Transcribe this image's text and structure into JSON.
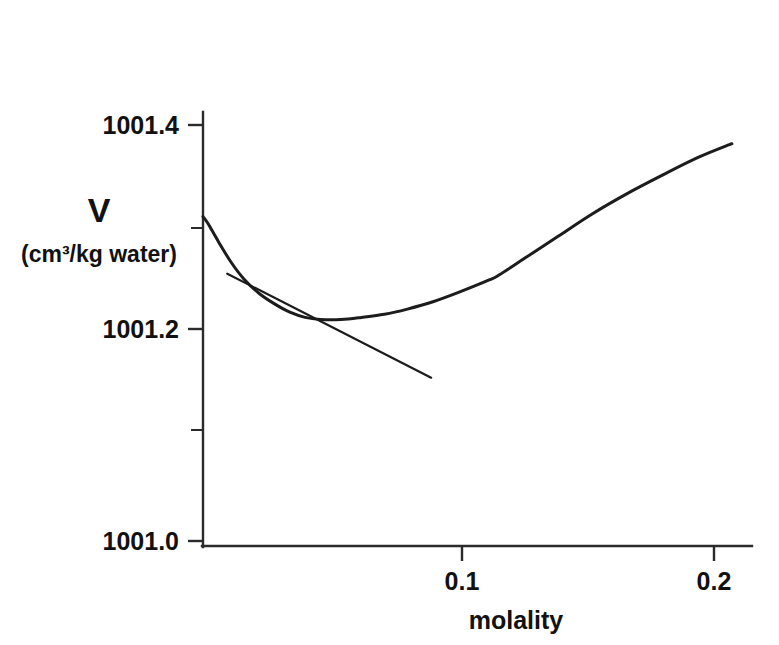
{
  "chart_data": {
    "type": "line",
    "title": "",
    "subtitle": "",
    "xlabel": "molality",
    "ylabel": "V",
    "ylabel_units": "(cm³/kg water)",
    "xlim": [
      0.0,
      0.218
    ],
    "ylim": [
      1001.0,
      1001.44
    ],
    "grid": false,
    "legend": null,
    "x_ticks": [
      {
        "value": 0.1,
        "label": "0.1"
      },
      {
        "value": 0.2,
        "label": "0.2"
      }
    ],
    "y_ticks": [
      {
        "value": 1001.4,
        "label": "1001.4",
        "kind": "major"
      },
      {
        "value": 1001.3,
        "label": "",
        "kind": "minor"
      },
      {
        "value": 1001.2,
        "label": "1001.2",
        "kind": "major"
      },
      {
        "value": 1001.1,
        "label": "",
        "kind": "minor"
      },
      {
        "value": 1001.0,
        "label": "1001.0",
        "kind": "major"
      }
    ],
    "series": [
      {
        "name": "partial-molar-volume-curve",
        "kind": "curve",
        "x": [
          0.0,
          0.002,
          0.006,
          0.011,
          0.016,
          0.022,
          0.028,
          0.034,
          0.04,
          0.046,
          0.054,
          0.062,
          0.071,
          0.08,
          0.09,
          0.1,
          0.112,
          0.116,
          0.126,
          0.139,
          0.152,
          0.166,
          0.18,
          0.194,
          0.207
        ],
        "y": [
          1001.312,
          1001.305,
          1001.288,
          1001.268,
          1001.252,
          1001.238,
          1001.228,
          1001.22,
          1001.215,
          1001.213,
          1001.213,
          1001.215,
          1001.218,
          1001.223,
          1001.23,
          1001.239,
          1001.251,
          1001.256,
          1001.272,
          1001.293,
          1001.314,
          1001.334,
          1001.352,
          1001.369,
          1001.382
        ]
      },
      {
        "name": "tangent-line",
        "kind": "line",
        "x": [
          0.0095,
          1e-09
        ],
        "y": [
          1001.257,
          1001.157
        ],
        "x_end": 0.0893
      }
    ],
    "annotations": [
      {
        "name": "tangent-at-minimum-construction-line",
        "text": "",
        "from": {
          "x": 0.0095,
          "y": 1001.257
        },
        "to": {
          "x": 0.0893,
          "y": 1001.157
        }
      }
    ],
    "minimum": {
      "x": 0.046,
      "y": 1001.213
    },
    "colors": {
      "curve": "#1c1c1c",
      "tangent": "#1c1c1c",
      "axis": "#2b2b2b",
      "text": "#111111",
      "background": "#ffffff"
    }
  },
  "labels": {
    "y_axis_symbol": "V",
    "y_axis_units": "(cm³/kg water)",
    "x_axis_title": "molality",
    "y_tick_top": "1001.4",
    "y_tick_mid": "1001.2",
    "y_tick_bottom": "1001.0",
    "x_tick_first": "0.1",
    "x_tick_second": "0.2"
  }
}
